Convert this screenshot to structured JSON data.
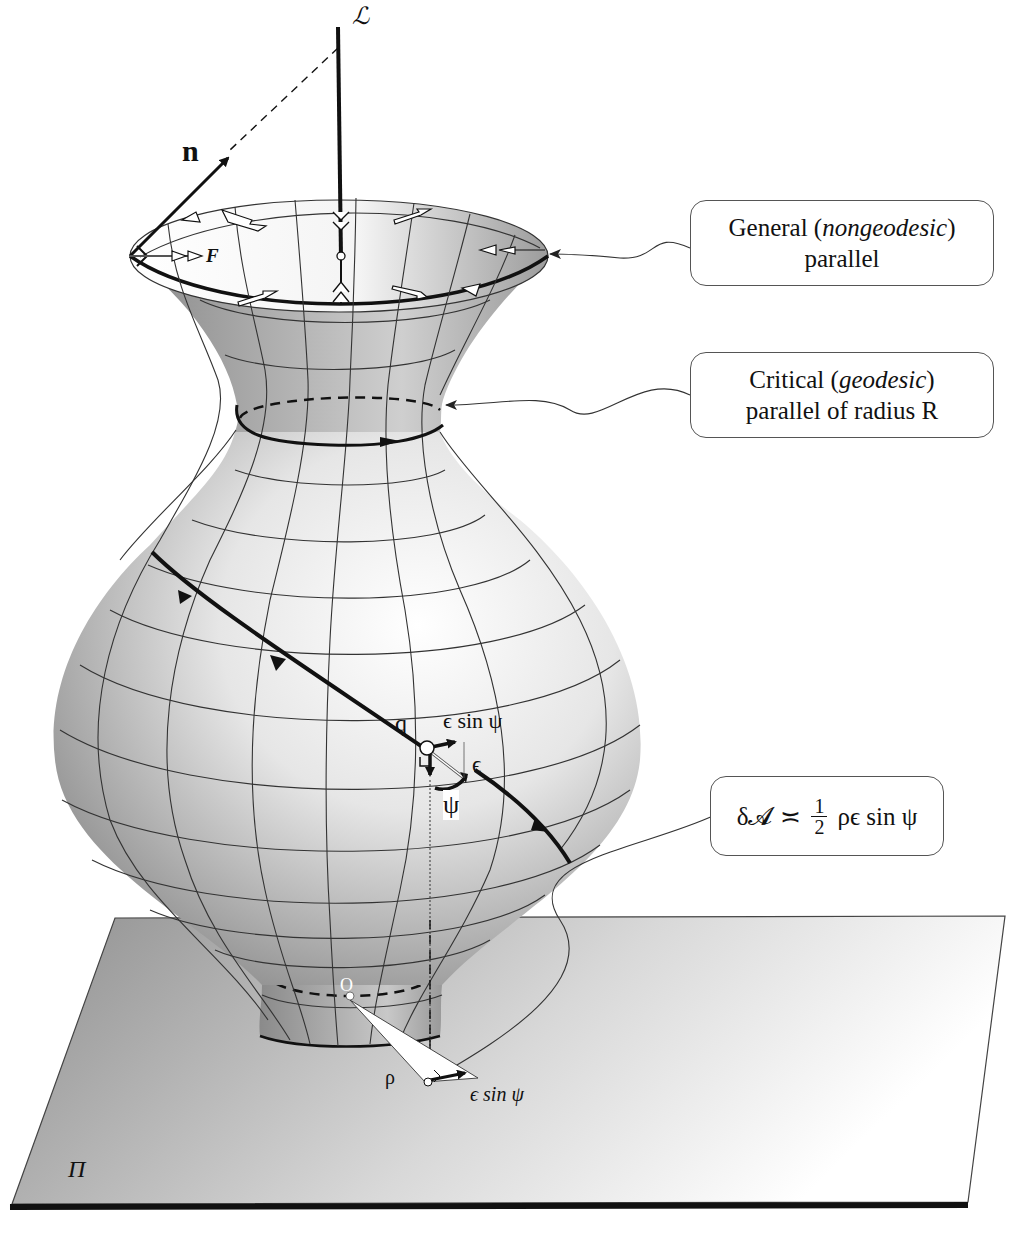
{
  "figure": {
    "labels": {
      "axis_label": "ℒ",
      "normal_label": "n",
      "force_label": "F",
      "point_q": "q",
      "eps_sin_psi_top": "ϵ sin ψ",
      "epsilon": "ϵ",
      "psi": "ψ",
      "rho": "ρ",
      "origin": "O",
      "eps_sin_psi_bottom": "ϵ sin ψ",
      "plane": "Π"
    },
    "callouts": {
      "general_parallel": {
        "line1_prefix": "General (",
        "line1_italic": "nongeodesic",
        "line1_suffix": ")",
        "line2": "parallel"
      },
      "critical_parallel": {
        "line1_prefix": "Critical (",
        "line1_italic": "geodesic",
        "line1_suffix": ")",
        "line2": "parallel of radius R"
      },
      "area_formula": {
        "lhs": "δ𝓐",
        "relation": "≍",
        "numerator": "1",
        "denominator": "2",
        "rhs": "ρϵ sin ψ"
      }
    },
    "colors": {
      "surface_light": "#ffffff",
      "surface_dark": "#8a8a8a",
      "plane_dark": "#9a9a9a",
      "plane_light": "#ffffff",
      "ink": "#111111"
    }
  }
}
